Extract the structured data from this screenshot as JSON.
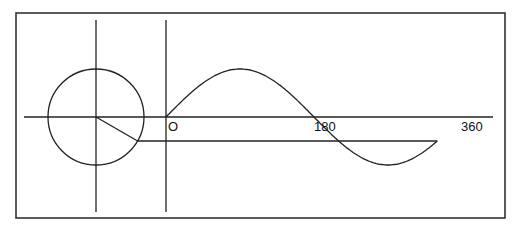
{
  "diagram": {
    "frame": {
      "x": 16,
      "y": 13,
      "width": 489,
      "height": 205
    },
    "colors": {
      "line": "#222222",
      "frame": "#333333",
      "background": "#ffffff"
    },
    "circle": {
      "cx": 96,
      "cy": 117,
      "r": 48
    },
    "circle_axes": {
      "horizontal": {
        "x1": 24,
        "x2": 493,
        "y": 117
      },
      "vertical_circle": {
        "x": 96,
        "y1": 20,
        "y2": 212
      },
      "vertical_origin": {
        "x": 166,
        "y1": 20,
        "y2": 212
      }
    },
    "radius_angle_deg": -30,
    "sine_wave": {
      "origin_x": 166,
      "baseline_y": 117,
      "amplitude": 48,
      "px_per_degree": 0.822,
      "end_angle_deg": 330
    },
    "projection_line": {
      "y": 141
    },
    "axis_labels": [
      {
        "text": "O",
        "x": 168,
        "y": 131
      },
      {
        "text": "180",
        "x": 314,
        "y": 131
      },
      {
        "text": "360",
        "x": 461,
        "y": 131
      }
    ]
  }
}
